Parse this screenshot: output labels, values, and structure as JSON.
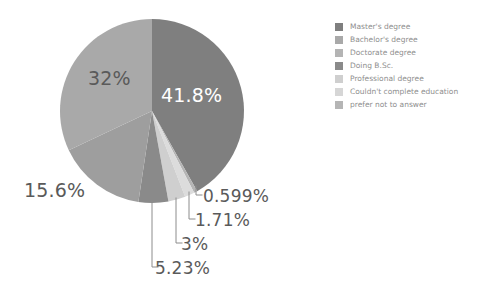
{
  "chart_data": {
    "type": "pie",
    "title": "",
    "categories": [
      "Master's degree",
      "Bachelor's degree",
      "Doctorate degree",
      "Doing B.Sc.",
      "Professional degree",
      "Couldn't complete education",
      "prefer not to answer"
    ],
    "values": [
      41.8,
      32,
      15.6,
      5.23,
      3,
      1.71,
      0.599
    ],
    "value_labels": [
      "41.8%",
      "32%",
      "15.6%",
      "5.23%",
      "3%",
      "1.71%",
      "0.599%"
    ],
    "unit": "%",
    "legend_position": "right",
    "grid": false,
    "draw_order_clockwise_from_top": [
      "Master's degree",
      "prefer not to answer",
      "Couldn't complete education",
      "Professional degree",
      "Doing B.Sc.",
      "Doctorate degree",
      "Bachelor's degree"
    ],
    "colors": {
      "Master's degree": "#7f7f7f",
      "Bachelor's degree": "#a9a9a9",
      "Doctorate degree": "#9e9e9e",
      "Doing B.Sc.": "#8a8a8a",
      "Professional degree": "#cfcfcf",
      "Couldn't complete education": "#dcdcdc",
      "prefer not to answer": "#b5b5b5"
    },
    "background": "#ffffff",
    "label_text_color": "#5a5a5a",
    "inside_label_text_color": "#ffffff",
    "leader_line_color": "#8c8c8c"
  },
  "legend": {
    "items": [
      {
        "label": "Master's degree",
        "color": "#7f7f7f"
      },
      {
        "label": "Bachelor's degree",
        "color": "#a9a9a9"
      },
      {
        "label": "Doctorate degree",
        "color": "#b4b4b4"
      },
      {
        "label": "Doing B.Sc.",
        "color": "#8a8a8a"
      },
      {
        "label": "Professional degree",
        "color": "#cfcfcf"
      },
      {
        "label": "Couldn't complete education",
        "color": "#d6d6d6"
      },
      {
        "label": "prefer not to answer",
        "color": "#b5b5b5"
      }
    ]
  },
  "labels": {
    "masters": "41.8%",
    "bachelors": "32%",
    "doctorate": "15.6%",
    "doing_bsc": "5.23%",
    "professional": "3%",
    "couldnt_complete": "1.71%",
    "prefer_not": "0.599%"
  }
}
